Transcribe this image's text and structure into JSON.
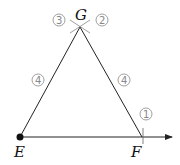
{
  "diagram": {
    "points": {
      "E": {
        "label": "E",
        "x": 20,
        "y": 137
      },
      "F": {
        "label": "F",
        "x": 142,
        "y": 137
      },
      "G": {
        "label": "G",
        "x": 80,
        "y": 27
      }
    },
    "step_markers": [
      {
        "id": "step-1",
        "text": "1",
        "near": "F"
      },
      {
        "id": "step-2",
        "text": "2",
        "near": "G right arc"
      },
      {
        "id": "step-3",
        "text": "3",
        "near": "G left arc"
      },
      {
        "id": "step-4a",
        "text": "4",
        "near": "segment EG"
      },
      {
        "id": "step-4b",
        "text": "4",
        "near": "segment FG"
      }
    ],
    "colors": {
      "line": "#222222",
      "arc": "#888888",
      "marker": "#888888"
    }
  }
}
